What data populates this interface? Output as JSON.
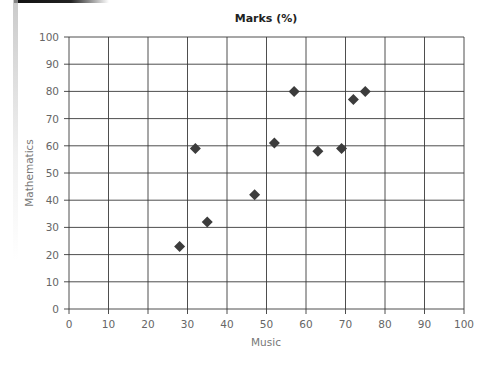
{
  "chart_data": {
    "type": "scatter",
    "title": "Marks (%)",
    "xlabel": "Music",
    "ylabel": "Mathematics",
    "xlim": [
      0,
      100
    ],
    "ylim": [
      0,
      100
    ],
    "xticks": [
      0,
      10,
      20,
      30,
      40,
      50,
      60,
      70,
      80,
      90,
      100
    ],
    "yticks": [
      0,
      10,
      20,
      30,
      40,
      50,
      60,
      70,
      80,
      90,
      100
    ],
    "grid": true,
    "legend": null,
    "marker": "diamond",
    "marker_color": "#3c3c3c",
    "points": [
      {
        "x": 28,
        "y": 23
      },
      {
        "x": 32,
        "y": 59
      },
      {
        "x": 35,
        "y": 32
      },
      {
        "x": 47,
        "y": 42
      },
      {
        "x": 52,
        "y": 61
      },
      {
        "x": 57,
        "y": 80
      },
      {
        "x": 63,
        "y": 58
      },
      {
        "x": 69,
        "y": 59
      },
      {
        "x": 72,
        "y": 77
      },
      {
        "x": 75,
        "y": 80
      }
    ]
  }
}
